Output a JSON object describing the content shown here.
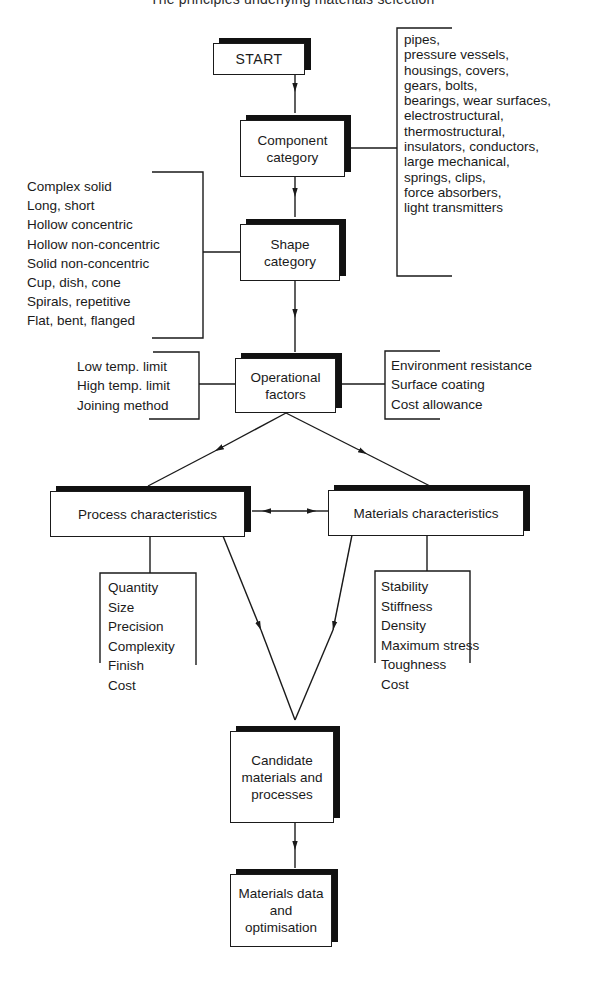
{
  "header": {
    "text": "The principles underlying materials selection"
  },
  "colors": {
    "ink": "#1a1a1a",
    "shadow": "#111111",
    "background": "#ffffff"
  },
  "nodes": {
    "start": "START",
    "component_category": "Component\ncategory",
    "shape_category": "Shape\ncategory",
    "operational_factors": "Operational\nfactors",
    "process_characteristics": "Process characteristics",
    "materials_characteristics": "Materials characteristics",
    "candidate": "Candidate\nmaterials and\nprocesses",
    "materials_data": "Materials data\nand\noptimisation"
  },
  "lists": {
    "component_examples": [
      "pipes,",
      "pressure vessels,",
      "housings, covers,",
      "gears, bolts,",
      "bearings, wear surfaces,",
      "electrostructural,",
      "thermostructural,",
      "insulators, conductors,",
      "large mechanical,",
      "springs, clips,",
      "force absorbers,",
      "light transmitters"
    ],
    "shape_examples": [
      "Complex solid",
      "Long, short",
      "Hollow concentric",
      "Hollow non-concentric",
      "Solid non-concentric",
      "Cup, dish, cone",
      "Spirals, repetitive",
      "Flat, bent, flanged"
    ],
    "operational_left": [
      "Low temp. limit",
      "High temp. limit",
      "Joining method"
    ],
    "operational_right": [
      "Environment resistance",
      "Surface coating",
      "Cost allowance"
    ],
    "process_factors": [
      "Quantity",
      "Size",
      "Precision",
      "Complexity",
      "Finish",
      "Cost"
    ],
    "material_factors": [
      "Stability",
      "Stiffness",
      "Density",
      "Maximum stress",
      "Toughness",
      "Cost"
    ]
  },
  "edges": [
    {
      "from": "START",
      "to": "Component category",
      "type": "arrow"
    },
    {
      "from": "Component category",
      "to": "Shape category",
      "type": "arrow"
    },
    {
      "from": "Shape category",
      "to": "Operational factors",
      "type": "arrow"
    },
    {
      "from": "Operational factors",
      "to": "Process characteristics",
      "type": "arrow"
    },
    {
      "from": "Operational factors",
      "to": "Materials characteristics",
      "type": "arrow"
    },
    {
      "from": "Process characteristics",
      "to": "Materials characteristics",
      "type": "bidirectional"
    },
    {
      "from": "Process characteristics",
      "to": "Candidate materials and processes",
      "type": "arrow"
    },
    {
      "from": "Materials characteristics",
      "to": "Candidate materials and processes",
      "type": "arrow"
    },
    {
      "from": "Candidate materials and processes",
      "to": "Materials data and optimisation",
      "type": "arrow"
    }
  ]
}
